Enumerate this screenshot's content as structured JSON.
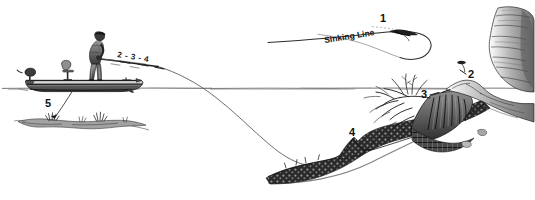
{
  "illustration": {
    "title": "Fly fishing sinking line presentation diagram",
    "style": "pen-and-ink line drawing",
    "background_color": "#ffffff",
    "ink_color": "#1a1a1a"
  },
  "labels": {
    "sinking_line": "Sinking Line",
    "rod_sequence": "2 - 3 - 4",
    "callout_1": "1",
    "callout_2": "2",
    "callout_3": "3",
    "callout_4": "4",
    "callout_5": "5"
  },
  "elements": {
    "boat": "boat",
    "angler": "standing angler",
    "seat": "pedestal seat",
    "motor": "outboard motor",
    "rod": "fly rod",
    "fly_line_loop": "airborne fly line loop",
    "fly": "fly",
    "waterline": "water surface",
    "anchor_line": "anchor line",
    "bottom_structure_left": "weed clump",
    "weed_bed": "submerged weed bed",
    "stump": "submerged tree stump with roots",
    "rock_point": "rocky point",
    "cliff": "rocky cliff bank"
  }
}
